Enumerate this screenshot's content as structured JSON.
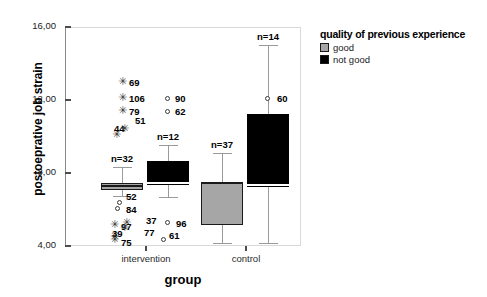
{
  "chart_data": {
    "type": "box",
    "title": "",
    "xlabel": "group",
    "ylabel": "postoeprative job strain",
    "ylim": [
      4.0,
      16.0
    ],
    "grid": false,
    "y_ticks": [
      {
        "value": 16.0,
        "label": "16,00"
      },
      {
        "value": 12.0,
        "label": "12,00"
      },
      {
        "value": 8.0,
        "label": "8,00"
      },
      {
        "value": 4.0,
        "label": "4,00"
      }
    ],
    "categories": [
      "intervention",
      "control"
    ],
    "legend": {
      "title": "quality of previous experience",
      "position": "right",
      "entries": [
        {
          "label": "good",
          "color": "#a6a6a6"
        },
        {
          "label": "not good",
          "color": "#000000"
        }
      ]
    },
    "series": [
      {
        "name": "good",
        "color": "#a6a6a6",
        "boxes": [
          {
            "category": "intervention",
            "n_label": "n=32",
            "n": 32,
            "whisker_low": 6.75,
            "q1": 7.05,
            "median": 7.3,
            "q3": 7.45,
            "whisker_high": 8.35,
            "outliers": [
              {
                "marker": "star",
                "label": "69",
                "value": 12.95
              },
              {
                "marker": "star",
                "label": "106",
                "value": 12.05
              },
              {
                "marker": "star",
                "label": "79",
                "value": 11.35
              },
              {
                "marker": "star",
                "label": "44",
                "value": 10.05
              },
              {
                "marker": "star",
                "label": "51",
                "value": 10.35
              },
              {
                "marker": "circle",
                "label": "52",
                "value": 6.35
              },
              {
                "marker": "circle",
                "label": "84",
                "value": 6.05
              },
              {
                "marker": "star",
                "label": "97",
                "value": 5.1
              },
              {
                "marker": "star",
                "label": "37",
                "value": 5.2
              },
              {
                "marker": "star",
                "label": "77",
                "value": 4.95
              },
              {
                "marker": "star",
                "label": "39",
                "value": 4.45
              },
              {
                "marker": "star",
                "label": "75",
                "value": 4.25
              }
            ]
          },
          {
            "category": "control",
            "n_label": "n=37",
            "n": 37,
            "whisker_low": 4.15,
            "q1": 5.15,
            "median": 7.45,
            "q3": 7.5,
            "whisker_high": 9.1,
            "outliers": []
          }
        ]
      },
      {
        "name": "not good",
        "color": "#000000",
        "boxes": [
          {
            "category": "intervention",
            "n_label": "n=12",
            "n": 12,
            "whisker_low": 6.7,
            "q1": 7.35,
            "median": 7.45,
            "q3": 8.65,
            "whisker_high": 9.55,
            "outliers": [
              {
                "marker": "circle",
                "label": "90",
                "value": 12.05
              },
              {
                "marker": "circle",
                "label": "62",
                "value": 11.35
              },
              {
                "marker": "circle",
                "label": "96",
                "value": 5.25
              },
              {
                "marker": "circle",
                "label": "61",
                "value": 4.35
              }
            ]
          },
          {
            "category": "control",
            "n_label": "n=14",
            "n": 14,
            "whisker_low": 4.15,
            "q1": 7.25,
            "median": 7.35,
            "q3": 11.25,
            "whisker_high": 15.0,
            "outliers": [
              {
                "marker": "circle",
                "label": "60",
                "value": 12.05
              }
            ]
          }
        ]
      }
    ],
    "annotations": [
      {
        "text": "n=32",
        "near": "intervention-good"
      },
      {
        "text": "n=12",
        "near": "intervention-not-good"
      },
      {
        "text": "n=37",
        "near": "control-good"
      },
      {
        "text": "n=14",
        "near": "control-not-good"
      }
    ]
  }
}
